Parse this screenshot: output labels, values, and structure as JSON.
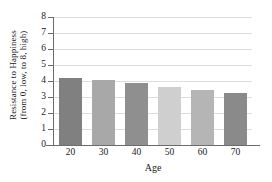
{
  "chart_data": {
    "type": "bar",
    "title": "",
    "xlabel": "Age",
    "ylabel": "Resistance to Happiness (from 0, low, to 8, high)",
    "ylabel_line1": "Resistance to Happiness",
    "ylabel_line2": "(from 0, low, to 8, high)",
    "categories": [
      "20",
      "30",
      "40",
      "50",
      "60",
      "70"
    ],
    "values": [
      4.2,
      4.05,
      3.85,
      3.65,
      3.45,
      3.25
    ],
    "bar_colors": [
      "#808080",
      "#a8a8a8",
      "#8f8f8f",
      "#cfcfcf",
      "#b5b5b5",
      "#8a8a8a"
    ],
    "ylim": [
      0,
      8
    ],
    "y_ticks": [
      "0",
      "1",
      "2",
      "3",
      "4",
      "5",
      "6",
      "7",
      "8"
    ],
    "grid": true,
    "grid_color": "#dedede",
    "legend": "none",
    "axis_color": "#6b6b6b",
    "background": "#ffffff"
  }
}
